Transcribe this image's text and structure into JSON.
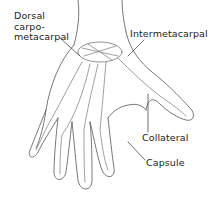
{
  "diagram": {
    "labels": [
      {
        "id": "dorsal-carpometacarpal",
        "text": "Dorsal\ncarpo-\nmetacarpal"
      },
      {
        "id": "intermetacarpal",
        "text": "Intermetacarpal"
      },
      {
        "id": "collateral",
        "text": "Collateral"
      },
      {
        "id": "capsule",
        "text": "Capsule"
      }
    ],
    "colors": {
      "line": "#4a4a4a",
      "background": "#ffffff",
      "text": "#222222"
    }
  }
}
